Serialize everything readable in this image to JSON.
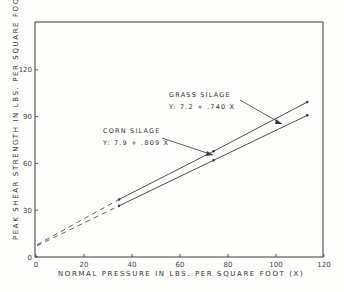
{
  "chart_data": {
    "type": "line",
    "title": "",
    "xlabel": "NORMAL PRESSURE IN LBS. PER SQUARE FOOT (X)",
    "ylabel": "PEAK SHEAR STRENGTH IN LBS. PER SQUARE FOOT (Y)",
    "xlim": [
      0,
      120
    ],
    "ylim": [
      0,
      150
    ],
    "x_ticks": [
      0,
      20,
      40,
      60,
      80,
      100,
      120
    ],
    "x_tick_labels": [
      "0",
      "20",
      "40",
      "60",
      "80",
      "100",
      "120"
    ],
    "y_ticks": [
      0,
      30,
      60,
      90,
      120
    ],
    "y_tick_labels": [
      "0",
      "30",
      "60",
      "90",
      "120"
    ],
    "grid": false,
    "series": [
      {
        "name": "CORN SILAGE",
        "equation": "Y: 7.9 + .809 X",
        "intercept": 7.9,
        "slope": 0.809,
        "x": [
          34.6,
          74,
          113
        ],
        "values": [
          36.9,
          67.8,
          99.3
        ],
        "extrapolated_dashed_from": [
          0,
          7.9
        ]
      },
      {
        "name": "GRASS SILAGE",
        "equation": "Y: 7.2 + .740 X",
        "intercept": 7.2,
        "slope": 0.74,
        "x": [
          34.6,
          74,
          113
        ],
        "values": [
          32.8,
          62.0,
          90.8
        ],
        "extrapolated_dashed_from": [
          0,
          7.2
        ]
      }
    ],
    "annotations": [
      {
        "text": "CORN SILAGE",
        "sub": "Y: 7.9 + .809 X"
      },
      {
        "text": "GRASS SILAGE",
        "sub": "Y: 7.2 + .740 X"
      }
    ]
  },
  "labels": {
    "corn_name": "CORN SILAGE",
    "corn_eq": "Y: 7.9 + .809 X",
    "grass_name": "GRASS SILAGE",
    "grass_eq": "Y: 7.2 + .740 X",
    "xlabel": "NORMAL PRESSURE IN LBS. PER SQUARE FOOT (X)",
    "ylabel": "PEAK SHEAR STRENGTH IN LBS. PER SQUARE FOOT (Y)"
  },
  "colors": {
    "ink": "#3a3a3a",
    "background": "#fdfdfb"
  }
}
